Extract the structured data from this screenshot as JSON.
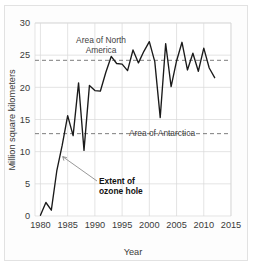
{
  "figure": {
    "name": "ozone-hole-extent-line-chart"
  },
  "axes": {
    "y_title": "Million square kilometers",
    "x_title": "Year",
    "y_ticks": [
      "0",
      "5",
      "10",
      "15",
      "20",
      "25",
      "30"
    ],
    "x_ticks": [
      "1980",
      "1985",
      "1990",
      "1995",
      "2000",
      "2005",
      "2010",
      "2015"
    ]
  },
  "annotations": {
    "north_america_line1": "Area of North",
    "north_america_line2": "America",
    "antarctica": "Area of Antarctica",
    "extent_line1": "Extent of",
    "extent_line2": "ozone hole"
  },
  "colors": {
    "data_line": "#1a1a1a",
    "reference_line": "#5d5d5d",
    "grid": "#d9d9d9",
    "axis": "#9a9a9a",
    "text": "#3a3a3a",
    "background": "#ffffff"
  },
  "chart_data": {
    "type": "line",
    "title": "",
    "xlabel": "Year",
    "ylabel": "Million square kilometers",
    "xlim": [
      1979,
      2015
    ],
    "ylim": [
      0,
      30
    ],
    "grid": true,
    "legend": "none",
    "x": [
      1980,
      1981,
      1982,
      1983,
      1984,
      1985,
      1986,
      1987,
      1988,
      1989,
      1990,
      1991,
      1992,
      1993,
      1994,
      1995,
      1996,
      1997,
      1998,
      1999,
      2000,
      2001,
      2002,
      2003,
      2004,
      2005,
      2006,
      2007,
      2008,
      2009,
      2010,
      2011,
      2012
    ],
    "series": [
      {
        "name": "Extent of ozone hole",
        "values": [
          0.1,
          2.1,
          0.9,
          7.0,
          11.0,
          15.6,
          12.5,
          20.7,
          10.2,
          20.3,
          19.5,
          19.4,
          22.3,
          24.8,
          23.7,
          23.6,
          22.6,
          25.8,
          23.8,
          25.6,
          27.1,
          24.0,
          15.3,
          26.8,
          20.1,
          24.1,
          27.0,
          22.7,
          25.3,
          22.5,
          26.1,
          23.0,
          21.5
        ]
      }
    ],
    "reference_lines": [
      {
        "label": "Area of North America",
        "value": 24.2,
        "style": "dashed"
      },
      {
        "label": "Area of Antarctica",
        "value": 12.8,
        "style": "dashed"
      }
    ],
    "callouts": [
      {
        "label": "Extent of ozone hole",
        "points_to_x": 1984,
        "points_to_y": 9.3
      }
    ]
  }
}
